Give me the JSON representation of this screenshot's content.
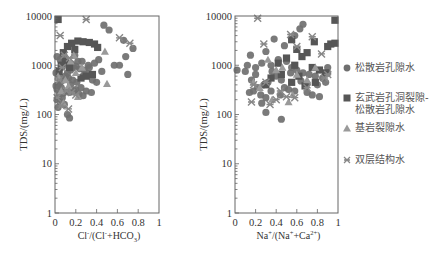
{
  "chart_data": [
    {
      "type": "scatter",
      "title": "",
      "xlabel": "Cl⁻/(Cl⁻+HCO₃⁻)",
      "xlabel_parts": [
        "Cl",
        "-",
        "/(Cl",
        "-",
        "+HCO",
        "3",
        ")"
      ],
      "ylabel": "TDS/(mg/L)",
      "xlim": [
        0,
        1
      ],
      "ylim": [
        1,
        10000
      ],
      "yscale": "log",
      "xticks": [
        "0",
        "0.2",
        "0.4",
        "0.6",
        "0.8",
        "1"
      ],
      "yticks": [
        "1",
        "10",
        "100",
        "1000",
        "10000"
      ],
      "grid": false,
      "series": [
        {
          "name": "松散岩孔隙水",
          "marker": "circle",
          "color": "#6f6f6f",
          "points": [
            [
              0.47,
              6500
            ],
            [
              0.52,
              5200
            ],
            [
              0.66,
              3200
            ],
            [
              0.75,
              2200
            ],
            [
              0.68,
              1500
            ],
            [
              0.57,
              1000
            ],
            [
              0.62,
              1000
            ],
            [
              0.7,
              650
            ],
            [
              0.42,
              1300
            ],
            [
              0.38,
              1100
            ],
            [
              0.33,
              900
            ],
            [
              0.45,
              750
            ],
            [
              0.3,
              700
            ],
            [
              0.27,
              600
            ],
            [
              0.36,
              500
            ],
            [
              0.4,
              450
            ],
            [
              0.22,
              1200
            ],
            [
              0.18,
              900
            ],
            [
              0.15,
              800
            ],
            [
              0.12,
              700
            ],
            [
              0.1,
              600
            ],
            [
              0.08,
              500
            ],
            [
              0.05,
              450
            ],
            [
              0.03,
              400
            ],
            [
              0.06,
              350
            ],
            [
              0.1,
              300
            ],
            [
              0.14,
              280
            ],
            [
              0.2,
              320
            ],
            [
              0.25,
              350
            ],
            [
              0.3,
              300
            ],
            [
              0.35,
              280
            ],
            [
              0.04,
              250
            ],
            [
              0.07,
              220
            ],
            [
              0.02,
              200
            ],
            [
              0.05,
              180
            ],
            [
              0.09,
              160
            ],
            [
              0.03,
              140
            ],
            [
              0.12,
              100
            ],
            [
              0.14,
              85
            ],
            [
              0.02,
              1500
            ],
            [
              0.05,
              1300
            ],
            [
              0.08,
              1100
            ],
            [
              0.11,
              1000
            ],
            [
              0.16,
              1050
            ],
            [
              0.2,
              950
            ],
            [
              0.24,
              850
            ],
            [
              0.28,
              800
            ],
            [
              0.01,
              700
            ],
            [
              0.04,
              600
            ],
            [
              0.13,
              550
            ],
            [
              0.17,
              500
            ],
            [
              0.21,
              450
            ],
            [
              0.01,
              380
            ],
            [
              0.06,
              900
            ],
            [
              0.09,
              1400
            ],
            [
              0.19,
              1600
            ],
            [
              0.26,
              1200
            ],
            [
              0.32,
              1000
            ],
            [
              0.15,
              400
            ],
            [
              0.18,
              300
            ],
            [
              0.23,
              260
            ],
            [
              0.27,
              240
            ],
            [
              0.02,
              320
            ],
            [
              0.08,
              270
            ]
          ]
        },
        {
          "name": "玄武岩孔洞裂隙-松散岩孔隙水",
          "marker": "square",
          "color": "#565656",
          "points": [
            [
              0.03,
              8500
            ],
            [
              0.22,
              3100
            ],
            [
              0.27,
              3000
            ],
            [
              0.33,
              2900
            ],
            [
              0.38,
              2700
            ],
            [
              0.41,
              2300
            ],
            [
              0.16,
              2800
            ],
            [
              0.12,
              2400
            ],
            [
              0.19,
              2100
            ],
            [
              0.08,
              1800
            ],
            [
              0.36,
              650
            ],
            [
              0.3,
              600
            ],
            [
              0.25,
              550
            ],
            [
              0.1,
              1200
            ],
            [
              0.06,
              1000
            ],
            [
              0.14,
              900
            ],
            [
              0.04,
              750
            ]
          ]
        },
        {
          "name": "基岩裂隙水",
          "marker": "triangle",
          "color": "#9a9a9a",
          "points": [
            [
              0.48,
              1900
            ],
            [
              0.26,
              900
            ],
            [
              0.5,
              420
            ],
            [
              0.18,
              1600
            ],
            [
              0.2,
              700
            ],
            [
              0.1,
              500
            ],
            [
              0.06,
              300
            ],
            [
              0.08,
              170
            ],
            [
              0.13,
              380
            ],
            [
              0.22,
              230
            ],
            [
              0.03,
              600
            ],
            [
              0.15,
              1200
            ]
          ]
        },
        {
          "name": "双层结构水",
          "marker": "x",
          "color": "#888888",
          "points": [
            [
              0.3,
              8500
            ],
            [
              0.62,
              3600
            ],
            [
              0.72,
              2800
            ],
            [
              0.05,
              4000
            ],
            [
              0.09,
              1600
            ],
            [
              0.14,
              1400
            ],
            [
              0.07,
              900
            ],
            [
              0.04,
              500
            ],
            [
              0.11,
              300
            ],
            [
              0.16,
              280
            ],
            [
              0.2,
              250
            ],
            [
              0.02,
              220
            ],
            [
              0.06,
              150
            ],
            [
              0.13,
              130
            ]
          ]
        }
      ]
    },
    {
      "type": "scatter",
      "title": "",
      "xlabel": "Na⁺/(Na⁺+Ca²⁺)",
      "xlabel_parts": [
        "Na",
        "+",
        "/(Na",
        "+",
        "+Ca",
        "2+",
        ")"
      ],
      "ylabel": "TDS/(mg/L)",
      "xlim": [
        0,
        1
      ],
      "ylim": [
        1,
        10000
      ],
      "yscale": "log",
      "xticks": [
        "0",
        "0.2",
        "0.4",
        "0.6",
        "0.8",
        "1"
      ],
      "yticks": [
        "1",
        "10",
        "100",
        "1000",
        "10000"
      ],
      "grid": false,
      "series": [
        {
          "name": "松散岩孔隙水",
          "marker": "circle",
          "color": "#6f6f6f",
          "points": [
            [
              0.66,
              6800
            ],
            [
              0.63,
              5500
            ],
            [
              0.58,
              4000
            ],
            [
              0.38,
              3400
            ],
            [
              0.48,
              2500
            ],
            [
              0.3,
              1900
            ],
            [
              0.15,
              1600
            ],
            [
              0.12,
              1000
            ],
            [
              0.02,
              800
            ],
            [
              0.1,
              750
            ],
            [
              0.2,
              900
            ],
            [
              0.26,
              1100
            ],
            [
              0.35,
              1000
            ],
            [
              0.42,
              1300
            ],
            [
              0.5,
              1200
            ],
            [
              0.55,
              900
            ],
            [
              0.6,
              800
            ],
            [
              0.66,
              700
            ],
            [
              0.72,
              650
            ],
            [
              0.78,
              600
            ],
            [
              0.85,
              550
            ],
            [
              0.4,
              600
            ],
            [
              0.45,
              500
            ],
            [
              0.32,
              450
            ],
            [
              0.28,
              400
            ],
            [
              0.22,
              350
            ],
            [
              0.18,
              300
            ],
            [
              0.14,
              280
            ],
            [
              0.25,
              250
            ],
            [
              0.3,
              220
            ],
            [
              0.35,
              300
            ],
            [
              0.48,
              350
            ],
            [
              0.52,
              320
            ],
            [
              0.58,
              300
            ],
            [
              0.7,
              280
            ],
            [
              0.75,
              250
            ],
            [
              0.82,
              230
            ],
            [
              0.44,
              250
            ],
            [
              0.26,
              170
            ],
            [
              0.3,
              110
            ],
            [
              0.45,
              80
            ],
            [
              0.16,
              500
            ],
            [
              0.2,
              650
            ],
            [
              0.36,
              750
            ],
            [
              0.54,
              700
            ],
            [
              0.64,
              480
            ],
            [
              0.7,
              420
            ],
            [
              0.8,
              400
            ],
            [
              0.88,
              450
            ],
            [
              0.9,
              700
            ],
            [
              0.9,
              900
            ]
          ]
        },
        {
          "name": "玄武岩孔洞裂隙-松散岩孔隙水",
          "marker": "square",
          "color": "#565656",
          "points": [
            [
              0.97,
              8200
            ],
            [
              0.55,
              3300
            ],
            [
              0.77,
              3000
            ],
            [
              0.93,
              2700
            ],
            [
              0.97,
              2800
            ],
            [
              0.9,
              2400
            ],
            [
              0.6,
              2100
            ],
            [
              0.65,
              1500
            ],
            [
              0.7,
              1800
            ],
            [
              0.5,
              1400
            ],
            [
              0.42,
              1100
            ],
            [
              0.58,
              1000
            ],
            [
              0.75,
              900
            ],
            [
              0.82,
              800
            ],
            [
              0.88,
              700
            ],
            [
              0.45,
              650
            ],
            [
              0.62,
              600
            ],
            [
              0.35,
              550
            ],
            [
              0.55,
              450
            ],
            [
              0.3,
              400
            ],
            [
              0.68,
              380
            ],
            [
              0.78,
              450
            ]
          ]
        },
        {
          "name": "基岩裂隙水",
          "marker": "triangle",
          "color": "#9a9a9a",
          "points": [
            [
              0.32,
              1300
            ],
            [
              0.46,
              900
            ],
            [
              0.7,
              500
            ],
            [
              0.36,
              200
            ],
            [
              0.52,
              180
            ],
            [
              0.24,
              350
            ],
            [
              0.6,
              650
            ],
            [
              0.78,
              900
            ],
            [
              0.18,
              450
            ],
            [
              0.56,
              250
            ],
            [
              0.4,
              800
            ]
          ]
        },
        {
          "name": "双层结构水",
          "marker": "x",
          "color": "#888888",
          "points": [
            [
              0.22,
              9000
            ],
            [
              0.54,
              4200
            ],
            [
              0.28,
              2700
            ],
            [
              0.75,
              3800
            ],
            [
              0.6,
              2400
            ],
            [
              0.84,
              1700
            ],
            [
              0.87,
              550
            ],
            [
              0.9,
              650
            ],
            [
              0.16,
              180
            ],
            [
              0.34,
              160
            ],
            [
              0.4,
              200
            ],
            [
              0.5,
              230
            ],
            [
              0.58,
              220
            ],
            [
              0.18,
              400
            ],
            [
              0.3,
              450
            ],
            [
              0.44,
              300
            ],
            [
              0.7,
              350
            ]
          ]
        }
      ]
    }
  ],
  "legend": {
    "items": [
      {
        "label": "松散岩孔隙水",
        "marker": "circle"
      },
      {
        "label": "玄武岩孔洞裂隙-\n松散岩孔隙水",
        "marker": "square"
      },
      {
        "label": "基岩裂隙水",
        "marker": "triangle"
      },
      {
        "label": "双层结构水",
        "marker": "x"
      }
    ]
  }
}
